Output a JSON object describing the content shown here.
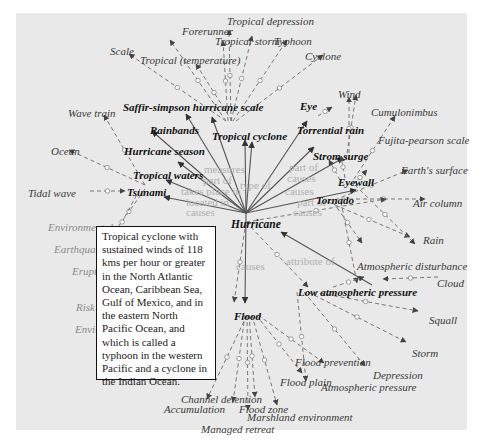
{
  "diagram": {
    "background_color": "#e9e9e9",
    "edge_solid_color": "#555555",
    "edge_dashed_color": "#777777",
    "central_node": "Hurricane",
    "nodes": [
      {
        "id": "tropical_depression",
        "label": "Tropical depression",
        "x": 227,
        "y": 15,
        "style": "normal"
      },
      {
        "id": "forerunner",
        "label": "Forerunner",
        "x": 182,
        "y": 25,
        "style": "normal"
      },
      {
        "id": "tropical_storm",
        "label": "Tropical storm",
        "x": 215,
        "y": 35,
        "style": "normal"
      },
      {
        "id": "typhoon",
        "label": "Typhoon",
        "x": 274,
        "y": 35,
        "style": "normal"
      },
      {
        "id": "scale",
        "label": "Scale",
        "x": 110,
        "y": 45,
        "style": "normal"
      },
      {
        "id": "tropical_temperature",
        "label": "Tropical (temperature)",
        "x": 140,
        "y": 54,
        "style": "normal"
      },
      {
        "id": "cyclone",
        "label": "Cyclone",
        "x": 305,
        "y": 50,
        "style": "normal"
      },
      {
        "id": "saffir_simpson",
        "label": "Saffir-simpson hurricane scale",
        "x": 123,
        "y": 101,
        "style": "bold"
      },
      {
        "id": "eye",
        "label": "Eye",
        "x": 300,
        "y": 100,
        "style": "bold"
      },
      {
        "id": "wind",
        "label": "Wind",
        "x": 338,
        "y": 88,
        "style": "normal"
      },
      {
        "id": "cumulonimbus",
        "label": "Cumulonimbus",
        "x": 371,
        "y": 106,
        "style": "normal"
      },
      {
        "id": "wave_train",
        "label": "Wave train",
        "x": 68,
        "y": 107,
        "style": "normal"
      },
      {
        "id": "rainbands",
        "label": "Rainbands",
        "x": 150,
        "y": 124,
        "style": "bold"
      },
      {
        "id": "tropical_cyclone",
        "label": "Tropical cyclone",
        "x": 212,
        "y": 130,
        "style": "bold"
      },
      {
        "id": "torrential_rain",
        "label": "Torrential rain",
        "x": 297,
        "y": 124,
        "style": "bold"
      },
      {
        "id": "fujita_pearson",
        "label": "Fujita-pearson scale",
        "x": 378,
        "y": 134,
        "style": "normal"
      },
      {
        "id": "ocean",
        "label": "Ocean",
        "x": 51,
        "y": 145,
        "style": "normal"
      },
      {
        "id": "hurricane_season",
        "label": "Hurricane season",
        "x": 124,
        "y": 145,
        "style": "bold"
      },
      {
        "id": "strom_surge",
        "label": "Strom surge",
        "x": 313,
        "y": 150,
        "style": "bold"
      },
      {
        "id": "tropical_waters",
        "label": "Tropical waters",
        "x": 133,
        "y": 169,
        "style": "bold"
      },
      {
        "id": "eyewall",
        "label": "Eyewall",
        "x": 338,
        "y": 176,
        "style": "bold"
      },
      {
        "id": "earths_surface",
        "label": "Earth's surface",
        "x": 401,
        "y": 164,
        "style": "normal"
      },
      {
        "id": "tidal_wave",
        "label": "Tidal wave",
        "x": 28,
        "y": 187,
        "style": "normal"
      },
      {
        "id": "tsunami",
        "label": "Tsunami",
        "x": 127,
        "y": 186,
        "style": "bold"
      },
      {
        "id": "tornado",
        "label": "Tornado",
        "x": 316,
        "y": 194,
        "style": "bold"
      },
      {
        "id": "air_column",
        "label": "Air column",
        "x": 413,
        "y": 197,
        "style": "normal"
      },
      {
        "id": "hurricane",
        "label": "Hurricane",
        "x": 231,
        "y": 218,
        "style": "hub"
      },
      {
        "id": "environmental",
        "label": "Environmental",
        "x": 48,
        "y": 221,
        "style": "faded"
      },
      {
        "id": "earthquake",
        "label": "Earthquake",
        "x": 54,
        "y": 243,
        "style": "faded"
      },
      {
        "id": "rain",
        "label": "Rain",
        "x": 423,
        "y": 234,
        "style": "normal"
      },
      {
        "id": "eruption",
        "label": "Eruption",
        "x": 72,
        "y": 265,
        "style": "faded"
      },
      {
        "id": "atmospheric_disturbance",
        "label": "Atmospheric disturbance",
        "x": 357,
        "y": 260,
        "style": "normal"
      },
      {
        "id": "cloud",
        "label": "Cloud",
        "x": 437,
        "y": 277,
        "style": "normal"
      },
      {
        "id": "low_atmospheric_pressure",
        "label": "Low atmospheric pressure",
        "x": 298,
        "y": 286,
        "style": "bold"
      },
      {
        "id": "risk",
        "label": "Risk",
        "x": 76,
        "y": 301,
        "style": "faded"
      },
      {
        "id": "squall",
        "label": "Squall",
        "x": 429,
        "y": 314,
        "style": "normal"
      },
      {
        "id": "flood",
        "label": "Flood",
        "x": 234,
        "y": 310,
        "style": "bold"
      },
      {
        "id": "environment",
        "label": "Environment",
        "x": 75,
        "y": 323,
        "style": "faded"
      },
      {
        "id": "flood_prevention",
        "label": "Flood prevention",
        "x": 295,
        "y": 356,
        "style": "normal"
      },
      {
        "id": "storm",
        "label": "Storm",
        "x": 412,
        "y": 347,
        "style": "normal"
      },
      {
        "id": "flood_plain",
        "label": "Flood plain",
        "x": 280,
        "y": 376,
        "style": "normal"
      },
      {
        "id": "depression",
        "label": "Depression",
        "x": 373,
        "y": 369,
        "style": "normal"
      },
      {
        "id": "atmospheric_pressure",
        "label": "Atmospheric pressure",
        "x": 321,
        "y": 381,
        "style": "normal"
      },
      {
        "id": "channel_detention",
        "label": "Channel detention",
        "x": 181,
        "y": 393,
        "style": "normal"
      },
      {
        "id": "accumulation",
        "label": "Accumulation",
        "x": 164,
        "y": 403,
        "style": "normal"
      },
      {
        "id": "flood_zone",
        "label": "Flood zone",
        "x": 239,
        "y": 403,
        "style": "normal"
      },
      {
        "id": "marshland_environment",
        "label": "Marshland environment",
        "x": 247,
        "y": 411,
        "style": "normal"
      },
      {
        "id": "managed_retreat",
        "label": "Managed retreat",
        "x": 201,
        "y": 423,
        "style": "normal"
      }
    ],
    "relation_labels": [
      {
        "label": "measures",
        "x": 204,
        "y": 164
      },
      {
        "label": "part of",
        "x": 203,
        "y": 175
      },
      {
        "label": "takes place in",
        "x": 181,
        "y": 186
      },
      {
        "label": "located in",
        "x": 186,
        "y": 197
      },
      {
        "label": "causes",
        "x": 186,
        "y": 207
      },
      {
        "label": "type of",
        "x": 240,
        "y": 180
      },
      {
        "label": "part of",
        "x": 289,
        "y": 162
      },
      {
        "label": "causes",
        "x": 287,
        "y": 173
      },
      {
        "label": "causes",
        "x": 285,
        "y": 186
      },
      {
        "label": "part of",
        "x": 297,
        "y": 197
      },
      {
        "label": "causes",
        "x": 293,
        "y": 207
      },
      {
        "label": "causes",
        "x": 236,
        "y": 261
      },
      {
        "label": "attribute of",
        "x": 286,
        "y": 256
      }
    ],
    "popup": {
      "text": "Tropical cyclone with sustained winds of 118 kms per hour or greater in the North Atlantic Ocean, Caribbean Sea, Gulf of Mexico, and in the eastern North Pacific Ocean, and which is called a typhoon in the western Pacific and a cyclone in the Indian Ocean."
    },
    "edges_solid": [
      [
        246,
        213,
        212,
        117
      ],
      [
        246,
        213,
        245,
        140
      ],
      [
        246,
        213,
        252,
        142
      ],
      [
        246,
        213,
        307,
        121
      ],
      [
        246,
        213,
        314,
        147
      ],
      [
        246,
        213,
        343,
        158
      ],
      [
        246,
        213,
        356,
        190
      ],
      [
        246,
        213,
        186,
        114
      ],
      [
        246,
        213,
        152,
        131
      ],
      [
        246,
        213,
        166,
        180
      ],
      [
        246,
        213,
        178,
        162
      ],
      [
        246,
        213,
        164,
        197
      ],
      [
        246,
        213,
        245,
        303
      ],
      [
        372,
        285,
        281,
        232
      ]
    ],
    "edges_dashed": [
      [
        231,
        121,
        229,
        30
      ],
      [
        231,
        121,
        252,
        36
      ],
      [
        228,
        121,
        223,
        41
      ],
      [
        233,
        121,
        287,
        40
      ],
      [
        236,
        121,
        323,
        55
      ],
      [
        226,
        121,
        129,
        54
      ],
      [
        232,
        121,
        196,
        64
      ],
      [
        226,
        121,
        170,
        40
      ],
      [
        318,
        116,
        332,
        107
      ],
      [
        346,
        160,
        356,
        95
      ],
      [
        349,
        160,
        349,
        97
      ],
      [
        350,
        185,
        395,
        116
      ],
      [
        353,
        185,
        367,
        170
      ],
      [
        345,
        178,
        341,
        156
      ],
      [
        340,
        180,
        329,
        160
      ],
      [
        145,
        185,
        104,
        115
      ],
      [
        145,
        185,
        69,
        150
      ],
      [
        90,
        191,
        125,
        191
      ],
      [
        145,
        189,
        113,
        234
      ],
      [
        140,
        189,
        104,
        255
      ],
      [
        335,
        200,
        408,
        170
      ],
      [
        342,
        199,
        425,
        199
      ],
      [
        328,
        202,
        410,
        237
      ],
      [
        333,
        202,
        362,
        243
      ],
      [
        355,
        185,
        415,
        244
      ],
      [
        341,
        202,
        357,
        283
      ],
      [
        333,
        287,
        364,
        277
      ],
      [
        438,
        277,
        383,
        279
      ],
      [
        313,
        292,
        418,
        311
      ],
      [
        308,
        292,
        406,
        342
      ],
      [
        304,
        292,
        365,
        366
      ],
      [
        297,
        292,
        306,
        381
      ],
      [
        247,
        315,
        248,
        410
      ],
      [
        245,
        315,
        233,
        402
      ],
      [
        247,
        315,
        207,
        399
      ],
      [
        249,
        315,
        255,
        397
      ],
      [
        252,
        315,
        277,
        405
      ],
      [
        256,
        315,
        302,
        373
      ],
      [
        258,
        315,
        324,
        363
      ],
      [
        246,
        222,
        234,
        302
      ],
      [
        246,
        222,
        386,
        199
      ],
      [
        246,
        222,
        308,
        287
      ]
    ]
  }
}
